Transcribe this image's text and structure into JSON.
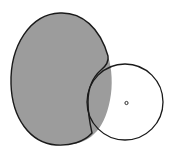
{
  "diagram": {
    "width": 173,
    "height": 150,
    "background": "#ffffff",
    "shapes": [
      {
        "id": "gray-ellipse",
        "type": "blob",
        "fill": "#9c9c9c",
        "stroke": "#1a1a1a",
        "stroke_width": 1.4,
        "approx_center": [
          60,
          79
        ],
        "approx_rx": 49,
        "approx_ry": 66
      },
      {
        "id": "white-circle",
        "type": "circle",
        "cx": 125,
        "cy": 102,
        "r": 38,
        "fill": "none",
        "stroke": "#1a1a1a",
        "stroke_width": 1.3
      },
      {
        "id": "center-dot",
        "type": "circle",
        "cx": 126.5,
        "cy": 103,
        "r": 1.6,
        "fill": "#ffffff",
        "stroke": "#1a1a1a",
        "stroke_width": 0.9
      }
    ]
  }
}
